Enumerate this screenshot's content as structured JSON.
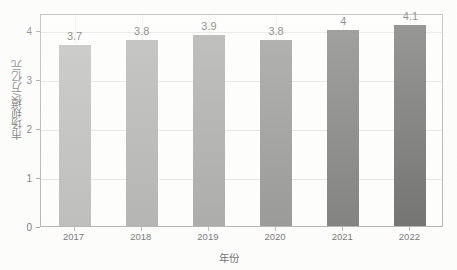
{
  "chart_data": {
    "type": "bar",
    "title": "",
    "xlabel": "年份",
    "ylabel": "市场规模/万亿元",
    "categories": [
      "2017",
      "2018",
      "2019",
      "2020",
      "2021",
      "2022"
    ],
    "values": [
      3.7,
      3.8,
      3.9,
      3.8,
      4,
      4.1
    ],
    "value_labels": [
      "3.7",
      "3.8",
      "3.9",
      "3.8",
      "4",
      "4.1"
    ],
    "series": [
      {
        "name": "市场规模",
        "values": [
          3.7,
          3.8,
          3.9,
          3.8,
          4,
          4.1
        ]
      }
    ],
    "ylim": [
      0,
      4.35
    ],
    "yticks": [
      0,
      1,
      2,
      3,
      4
    ],
    "ytick_labels": [
      "0",
      "1",
      "2",
      "3",
      "4"
    ],
    "xtick_labels": [
      "2017",
      "2018",
      "2019",
      "2020",
      "2021",
      "2022"
    ],
    "grid": "horizontal-and-vertical",
    "legend": "none",
    "bar_colors": [
      "#9a9a9a",
      "#8b8b8b",
      "#7d7d7d",
      "#606060",
      "#3a3a3a",
      "#242424"
    ],
    "frame_color": "#8d8d8d",
    "gridline_color": "#d8d8d8",
    "text_color": "#1d1d1d",
    "background": "#ffffff"
  }
}
